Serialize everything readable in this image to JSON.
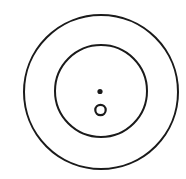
{
  "diagram": {
    "background": "#ffffff",
    "stroke_color": "#1a1a1a",
    "shapes": [
      {
        "name": "outer-circle",
        "cx": 101,
        "cy": 92,
        "r": 77,
        "stroke_width": 2
      },
      {
        "name": "inner-circle",
        "cx": 101,
        "cy": 91,
        "r": 46,
        "stroke_width": 2
      },
      {
        "name": "center-dot",
        "cx": 100,
        "cy": 91.5,
        "r": 2.6,
        "filled": true
      },
      {
        "name": "small-ring",
        "cx": 100.5,
        "cy": 110,
        "r": 5.2,
        "stroke_width": 2.2
      }
    ]
  }
}
